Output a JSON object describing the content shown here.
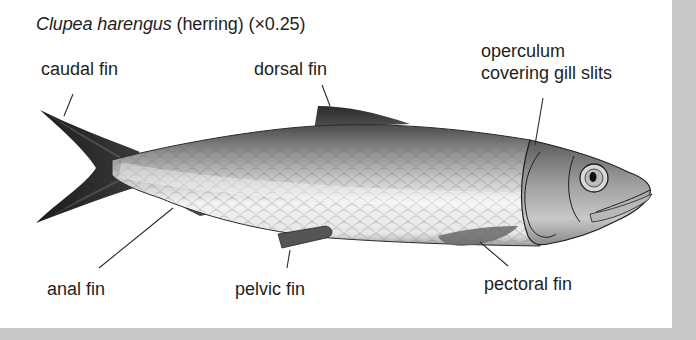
{
  "figure": {
    "title": {
      "scientific_name": "Clupea harengus",
      "common_name": " (herring)",
      "scale": " (×0.25)"
    },
    "labels": {
      "caudal_fin": "caudal fin",
      "dorsal_fin": "dorsal fin",
      "operculum_line1": "operculum",
      "operculum_line2": "covering gill slits",
      "anal_fin": "anal fin",
      "pelvic_fin": "pelvic fin",
      "pectoral_fin": "pectoral fin"
    },
    "colors": {
      "background": "#ffffff",
      "frame": "#c8c8c8",
      "text": "#1e1e1e",
      "fin_dark": "#2a2a2a",
      "body_light": "#f2f2f2",
      "body_dark": "#6e6e6e"
    }
  }
}
